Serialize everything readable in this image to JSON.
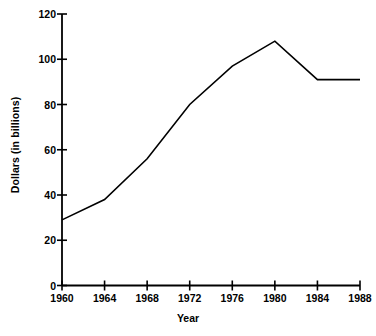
{
  "chart_data": {
    "type": "line",
    "title": "",
    "xlabel": "Year",
    "ylabel": "Dollars (in billions)",
    "x": [
      1960,
      1964,
      1968,
      1972,
      1976,
      1980,
      1984,
      1988
    ],
    "values": [
      29,
      38,
      56,
      80,
      97,
      108,
      91,
      91
    ],
    "xtick_labels": [
      "1960",
      "1964",
      "1968",
      "1972",
      "1976",
      "1980",
      "1984",
      "1988"
    ],
    "ytick_labels": [
      "0",
      "20",
      "40",
      "60",
      "80",
      "100",
      "120"
    ],
    "yticks": [
      0,
      20,
      40,
      60,
      80,
      100,
      120
    ],
    "xlim": [
      1960,
      1988
    ],
    "ylim": [
      0,
      120
    ],
    "grid": false,
    "legend": null,
    "line_color": "#000000",
    "background_color": "#ffffff"
  },
  "axes": {
    "y_title": "Dollars (in billions)",
    "x_title": "Year"
  }
}
